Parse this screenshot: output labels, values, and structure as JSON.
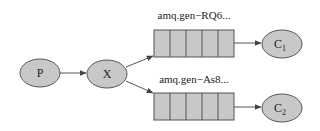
{
  "diagram": {
    "type": "rabbitmq-fanout",
    "colors": {
      "node_fill": "#c8c8c8",
      "stroke": "#555555",
      "edge": "#555555",
      "background": "#ffffff"
    },
    "nodes": {
      "producer": {
        "label": "P"
      },
      "exchange": {
        "label": "X"
      },
      "consumer1": {
        "label": "C",
        "subscript": "1"
      },
      "consumer2": {
        "label": "C",
        "subscript": "2"
      }
    },
    "queues": [
      {
        "label": "amq.gen−RQ6...",
        "cells": 5
      },
      {
        "label": "amq.gen−As8...",
        "cells": 5
      }
    ],
    "edges": [
      {
        "from": "P",
        "to": "X"
      },
      {
        "from": "X",
        "to": "amq.gen−RQ6..."
      },
      {
        "from": "X",
        "to": "amq.gen−As8..."
      },
      {
        "from": "amq.gen−RQ6...",
        "to": "C1"
      },
      {
        "from": "amq.gen−As8...",
        "to": "C2"
      }
    ]
  }
}
